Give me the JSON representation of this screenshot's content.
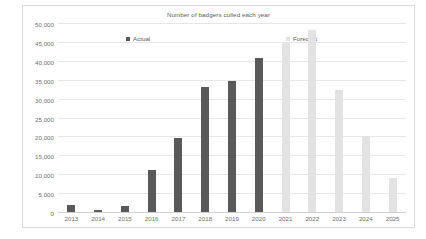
{
  "chart_data": {
    "type": "bar",
    "title": "Number of badgers culled each year",
    "xlabel": "",
    "ylabel": "",
    "ylim": [
      0,
      50000
    ],
    "yticks": [
      0,
      5000,
      10000,
      15000,
      20000,
      25000,
      30000,
      35000,
      40000,
      45000,
      50000
    ],
    "ytick_labels": [
      "0",
      "5,000",
      "10,000",
      "15,000",
      "20,000",
      "25,000",
      "30,000",
      "35,000",
      "40,000",
      "45,000",
      "50,000"
    ],
    "grid": "horizontal",
    "legend_position": "top-inside",
    "categories": [
      "2013",
      "2014",
      "2015",
      "2016",
      "2017",
      "2018",
      "2019",
      "2020",
      "2021",
      "2022",
      "2023",
      "2024",
      "2025"
    ],
    "series": [
      {
        "name": "Actual",
        "color": "#595959",
        "values": [
          1900,
          500,
          1500,
          11000,
          19500,
          33000,
          34600,
          40800,
          null,
          null,
          null,
          null,
          null
        ]
      },
      {
        "name": "Forecast",
        "color": "#e3e3e3",
        "values": [
          null,
          null,
          null,
          null,
          null,
          null,
          null,
          null,
          44800,
          48200,
          32200,
          20000,
          9000
        ]
      }
    ],
    "bars": [
      {
        "category": "2013",
        "value": 1900,
        "series": "Actual"
      },
      {
        "category": "2014",
        "value": 500,
        "series": "Actual"
      },
      {
        "category": "2015",
        "value": 1500,
        "series": "Actual"
      },
      {
        "category": "2016",
        "value": 11000,
        "series": "Actual"
      },
      {
        "category": "2017",
        "value": 19500,
        "series": "Actual"
      },
      {
        "category": "2018",
        "value": 33000,
        "series": "Actual"
      },
      {
        "category": "2019",
        "value": 34600,
        "series": "Actual"
      },
      {
        "category": "2020",
        "value": 40800,
        "series": "Actual"
      },
      {
        "category": "2021",
        "value": 44800,
        "series": "Forecast"
      },
      {
        "category": "2022",
        "value": 48200,
        "series": "Forecast"
      },
      {
        "category": "2023",
        "value": 32200,
        "series": "Forecast"
      },
      {
        "category": "2024",
        "value": 20000,
        "series": "Forecast"
      },
      {
        "category": "2025",
        "value": 9000,
        "series": "Forecast"
      }
    ]
  },
  "legend": {
    "actual_label": "Actual",
    "forecast_label": "Forecast"
  },
  "colors": {
    "actual": "#595959",
    "forecast": "#e3e3e3",
    "gridline": "#e6e6e6",
    "border": "#d9d9d9",
    "text": "#707070"
  }
}
